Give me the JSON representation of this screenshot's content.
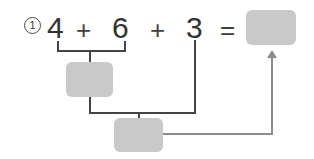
{
  "problem": {
    "number_label": "1",
    "equation": {
      "operand_1": "4",
      "operator_1": "+",
      "operand_2": "6",
      "operator_2": "+",
      "operand_3": "3",
      "equals": "="
    }
  },
  "answer_boxes": {
    "sum_4_plus_6": "",
    "sum_intermediate_plus_3": "",
    "final_total": ""
  },
  "icons": {
    "arrow_up": "arrow-up-icon",
    "bracket_upper": "bracket-icon",
    "bracket_lower": "bracket-icon"
  },
  "colors": {
    "box_fill": "#c9c9c9",
    "connector_dark": "#444444",
    "connector_light": "#8c8c8c",
    "text": "#333333",
    "background": "#ffffff"
  }
}
